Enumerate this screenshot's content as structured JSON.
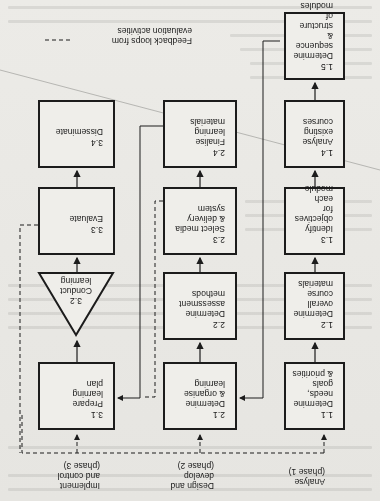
{
  "figure": {
    "orientation": "rotated 180 degrees",
    "phases": [
      {
        "id": "phase1",
        "label": "Analyse\n(phase 1)"
      },
      {
        "id": "phase2",
        "label": "Design and\ndevelop\n(phase 2)"
      },
      {
        "id": "phase3",
        "label": "Implement\nand control\n(phase 3)"
      }
    ],
    "column1": [
      {
        "num": "1.1",
        "text": "Determine\nneeds, goals\n& priorities"
      },
      {
        "num": "1.2",
        "text": "Determine\noverall course\nmaterials"
      },
      {
        "num": "1.3",
        "text": "Identify\nobjectives for\neach module"
      },
      {
        "num": "1.4",
        "text": "Analyse\nexisting\ncourses"
      },
      {
        "num": "1.5",
        "text": "Determine\nsequence &\nstructure of\nmodules"
      }
    ],
    "column2": [
      {
        "num": "2.1",
        "text": "Determine\n& organise\nlearning"
      },
      {
        "num": "2.2",
        "text": "Determine\nassessment\nmethods"
      },
      {
        "num": "2.3",
        "text": "Select media\n& delivery\nsystem"
      },
      {
        "num": "2.4",
        "text": "Finalise\nlearning\nmaterials"
      }
    ],
    "column3": [
      {
        "num": "3.1",
        "text": "Prepare\nlearning\nplan"
      },
      {
        "num": "3.2",
        "text": "Conduct\nlearning"
      },
      {
        "num": "3.3",
        "text": "Evaluate"
      },
      {
        "num": "3.4",
        "text": "Disseminate"
      }
    ],
    "legend": {
      "line_style": "dashed",
      "text": "Feedback loops from\nevaluation activities"
    },
    "colors": {
      "ink": "#1c1c1c",
      "paper": "#e9e8e4"
    }
  }
}
